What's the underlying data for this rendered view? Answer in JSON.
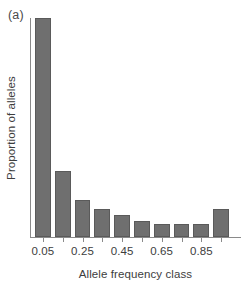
{
  "panel": {
    "label": "(a)"
  },
  "chart_data": {
    "type": "bar",
    "title": "",
    "subtitle": "",
    "xlabel": "Allele frequency class",
    "ylabel": "Proportion of alleles",
    "categories": [
      "0.05",
      "0.15",
      "0.25",
      "0.35",
      "0.45",
      "0.55",
      "0.65",
      "0.75",
      "0.85",
      "0.95"
    ],
    "tick_labels_shown": [
      "0.05",
      "",
      "0.25",
      "",
      "0.45",
      "",
      "0.65",
      "",
      "0.85",
      ""
    ],
    "values": [
      1.0,
      0.3,
      0.167,
      0.13,
      0.1,
      0.075,
      0.06,
      0.06,
      0.06,
      0.13
    ],
    "ylim": [
      0,
      1.0
    ],
    "xlim_categories": 10,
    "grid": false,
    "legend": false,
    "legend_position": "none",
    "bar_color": "#6f6f6f",
    "bar_edge_color": "#5a5a5a",
    "axis_color": "#8a8a8a",
    "y_axis_ticks_shown": false,
    "annotations": []
  }
}
